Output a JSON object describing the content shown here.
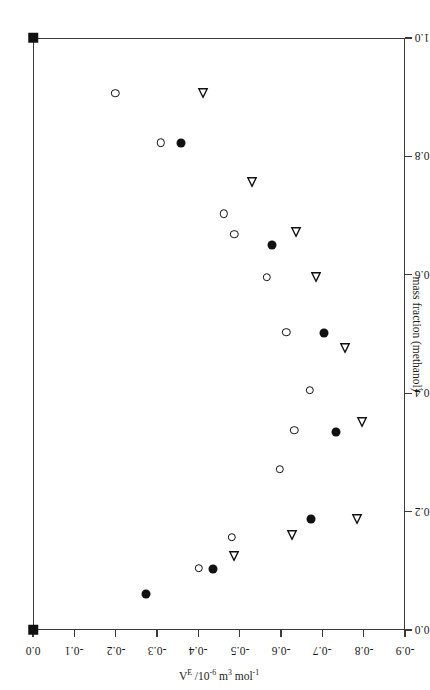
{
  "figure": {
    "orientation": "rotated-90-ccw",
    "background": "#ffffff",
    "ink_color": "#111111"
  },
  "axis": {
    "x_title": "mass fraction (methanol)",
    "y_title_parts": {
      "symbol": "V",
      "symbol_sup": "E",
      "mid": " /10",
      "mid_sup": "-6",
      "unit": " m",
      "unit_sup": "3",
      "unit2": " mol",
      "unit2_sup": "-1"
    },
    "y_title_plain": "V^E /10^-6 m^3 mol^-1",
    "x_ticks": [
      "0.0",
      "0.2",
      "0.4",
      "0.6",
      "0.8",
      "1.0"
    ],
    "y_ticks": [
      "0.0",
      "-0.1",
      "-0.2",
      "-0.3",
      "-0.4",
      "-0.5",
      "-0.6",
      "-0.7",
      "-0.8",
      "-0.9"
    ]
  },
  "chart_data": {
    "type": "scatter",
    "title": "",
    "xlabel": "mass fraction (methanol)",
    "ylabel": "V^E /10^-6 m^3 mol^-1",
    "xlim": [
      0.0,
      1.0
    ],
    "ylim": [
      -0.9,
      0.0
    ],
    "xticks": [
      0.0,
      0.2,
      0.4,
      0.6,
      0.8,
      1.0
    ],
    "yticks": [
      0.0,
      -0.1,
      -0.2,
      -0.3,
      -0.4,
      -0.5,
      -0.6,
      -0.7,
      -0.8,
      -0.9
    ],
    "grid": false,
    "legend": "none",
    "series": [
      {
        "name": "open-circle",
        "marker": "open-circle",
        "points": [
          {
            "x": 0.907,
            "y": -0.199
          },
          {
            "x": 0.823,
            "y": -0.309
          },
          {
            "x": 0.703,
            "y": -0.462
          },
          {
            "x": 0.669,
            "y": -0.487
          },
          {
            "x": 0.596,
            "y": -0.565
          },
          {
            "x": 0.503,
            "y": -0.613
          },
          {
            "x": 0.405,
            "y": -0.669
          },
          {
            "x": 0.338,
            "y": -0.632
          },
          {
            "x": 0.272,
            "y": -0.597
          },
          {
            "x": 0.157,
            "y": -0.481
          },
          {
            "x": 0.104,
            "y": -0.401
          }
        ]
      },
      {
        "name": "filled-circle",
        "marker": "filled-circle",
        "points": [
          {
            "x": 1.0,
            "y": 0.0,
            "marker": "filled-square"
          },
          {
            "x": 0.823,
            "y": -0.358
          },
          {
            "x": 0.65,
            "y": -0.578
          },
          {
            "x": 0.502,
            "y": -0.704
          },
          {
            "x": 0.334,
            "y": -0.734
          },
          {
            "x": 0.188,
            "y": -0.672
          },
          {
            "x": 0.103,
            "y": -0.435
          },
          {
            "x": 0.061,
            "y": -0.274
          },
          {
            "x": 0.0,
            "y": 0.0,
            "marker": "filled-square"
          }
        ]
      },
      {
        "name": "open-triangle",
        "marker": "open-triangle-left",
        "points": [
          {
            "x": 0.907,
            "y": -0.411
          },
          {
            "x": 0.757,
            "y": -0.53
          },
          {
            "x": 0.672,
            "y": -0.637
          },
          {
            "x": 0.596,
            "y": -0.685
          },
          {
            "x": 0.476,
            "y": -0.755
          },
          {
            "x": 0.351,
            "y": -0.796
          },
          {
            "x": 0.188,
            "y": -0.784
          },
          {
            "x": 0.16,
            "y": -0.627
          },
          {
            "x": 0.125,
            "y": -0.487
          }
        ]
      }
    ]
  }
}
